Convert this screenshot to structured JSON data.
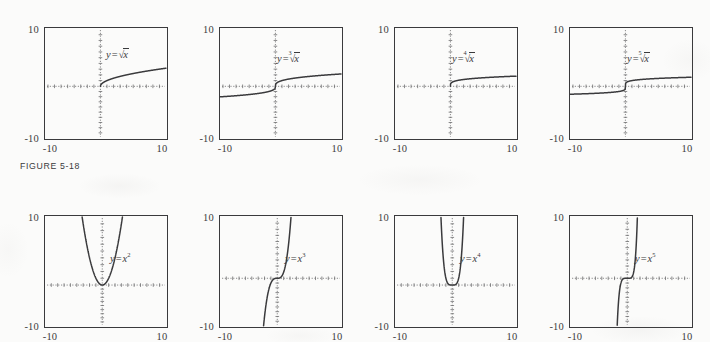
{
  "figure": {
    "caption": "FIGURE 5-18",
    "background_color": "#fbfbfa",
    "ink_color": "#3a3a3c",
    "axis_color": "#6e6e70"
  },
  "axis_labels": {
    "y_top": "10",
    "y_bottom": "-10",
    "x_left": "-10",
    "x_right": "10"
  },
  "chart_data": [
    {
      "type": "line",
      "panel": 1,
      "row": 1,
      "title": "y = √x",
      "label_parts": {
        "lhs": "y",
        "op": "=",
        "kind": "radical",
        "index": "",
        "radicand": "x"
      },
      "function": "sqrt(x)",
      "exponent": "1/2",
      "xlabel": "",
      "ylabel": "",
      "xlim": [
        -10,
        10
      ],
      "ylim": [
        -10,
        10
      ],
      "xticks": [
        "-10",
        "10"
      ],
      "yticks": [
        "10",
        "-10"
      ],
      "grid": false,
      "domain": [
        0,
        10
      ],
      "x": [
        0,
        0.5,
        1,
        2,
        3,
        4,
        5,
        6,
        7,
        8,
        9,
        10
      ],
      "y": [
        0,
        0.71,
        1,
        1.41,
        1.73,
        2,
        2.24,
        2.45,
        2.65,
        2.83,
        3,
        3.16
      ]
    },
    {
      "type": "line",
      "panel": 2,
      "row": 1,
      "title": "y = ∛ x",
      "label_parts": {
        "lhs": "y",
        "op": "=",
        "kind": "radical",
        "index": "3",
        "radicand": "x"
      },
      "function": "cbrt(x)",
      "exponent": "1/3",
      "xlabel": "",
      "ylabel": "",
      "xlim": [
        -10,
        10
      ],
      "ylim": [
        -10,
        10
      ],
      "xticks": [
        "-10",
        "10"
      ],
      "yticks": [
        "10",
        "-10"
      ],
      "grid": false,
      "domain": [
        -10,
        10
      ],
      "x": [
        -10,
        -8,
        -6,
        -4,
        -2,
        -1,
        0,
        1,
        2,
        4,
        6,
        8,
        10
      ],
      "y": [
        -2.15,
        -2,
        -1.82,
        -1.59,
        -1.26,
        -1,
        0,
        1,
        1.26,
        1.59,
        1.82,
        2,
        2.15
      ]
    },
    {
      "type": "line",
      "panel": 3,
      "row": 1,
      "title": "y = ⁴√x",
      "label_parts": {
        "lhs": "y",
        "op": "=",
        "kind": "radical",
        "index": "4",
        "radicand": "x"
      },
      "function": "x^(1/4)",
      "exponent": "1/4",
      "xlabel": "",
      "ylabel": "",
      "xlim": [
        -10,
        10
      ],
      "ylim": [
        -10,
        10
      ],
      "xticks": [
        "-10",
        "10"
      ],
      "yticks": [
        "10",
        "-10"
      ],
      "grid": false,
      "domain": [
        0,
        10
      ],
      "x": [
        0,
        0.5,
        1,
        2,
        3,
        4,
        5,
        6,
        7,
        8,
        9,
        10
      ],
      "y": [
        0,
        0.84,
        1,
        1.19,
        1.32,
        1.41,
        1.5,
        1.57,
        1.63,
        1.68,
        1.73,
        1.78
      ]
    },
    {
      "type": "line",
      "panel": 4,
      "row": 1,
      "title": "y = ⁵√x",
      "label_parts": {
        "lhs": "y",
        "op": "=",
        "kind": "radical",
        "index": "5",
        "radicand": "x"
      },
      "function": "x^(1/5)",
      "exponent": "1/5",
      "xlabel": "",
      "ylabel": "",
      "xlim": [
        -10,
        10
      ],
      "ylim": [
        -10,
        10
      ],
      "xticks": [
        "-10",
        "10"
      ],
      "yticks": [
        "10",
        "-10"
      ],
      "grid": false,
      "domain": [
        -10,
        10
      ],
      "x": [
        -10,
        -8,
        -6,
        -4,
        -2,
        -1,
        0,
        1,
        2,
        4,
        6,
        8,
        10
      ],
      "y": [
        -1.58,
        -1.52,
        -1.43,
        -1.32,
        -1.15,
        -1,
        0,
        1,
        1.15,
        1.32,
        1.43,
        1.52,
        1.58
      ]
    },
    {
      "type": "line",
      "panel": 5,
      "row": 2,
      "title": "y = x2",
      "label_parts": {
        "lhs": "y",
        "op": "=",
        "kind": "power",
        "base": "x",
        "exponent": "2"
      },
      "function": "x^2",
      "exponent": "2",
      "xlabel": "",
      "ylabel": "",
      "xlim": [
        -10,
        10
      ],
      "ylim": [
        -10,
        10
      ],
      "xticks": [
        "-10",
        "10"
      ],
      "yticks": [
        "10",
        "-10"
      ],
      "grid": false,
      "domain": [
        -3.16,
        3.16
      ],
      "x": [
        -3.16,
        -2.5,
        -2,
        -1.5,
        -1,
        -0.5,
        0,
        0.5,
        1,
        1.5,
        2,
        2.5,
        3.16
      ],
      "y": [
        10,
        6.25,
        4,
        2.25,
        1,
        0.25,
        0,
        0.25,
        1,
        2.25,
        4,
        6.25,
        10
      ]
    },
    {
      "type": "line",
      "panel": 6,
      "row": 2,
      "title": "y = x3",
      "label_parts": {
        "lhs": "y",
        "op": "=",
        "kind": "power",
        "base": "x",
        "exponent": "3"
      },
      "function": "x^3",
      "exponent": "3",
      "xlabel": "",
      "ylabel": "",
      "xlim": [
        -10,
        10
      ],
      "ylim": [
        -10,
        10
      ],
      "xticks": [
        "-10",
        "10"
      ],
      "yticks": [
        "10",
        "-10"
      ],
      "grid": false,
      "domain": [
        -2.15,
        2.15
      ],
      "x": [
        -2.15,
        -2,
        -1.5,
        -1,
        -0.5,
        0,
        0.5,
        1,
        1.5,
        2,
        2.15
      ],
      "y": [
        -10,
        -8,
        -3.38,
        -1,
        -0.13,
        0,
        0.13,
        1,
        3.38,
        8,
        10
      ]
    },
    {
      "type": "line",
      "panel": 7,
      "row": 2,
      "title": "y = x4",
      "label_parts": {
        "lhs": "y",
        "op": "=",
        "kind": "power",
        "base": "x",
        "exponent": "4"
      },
      "function": "x^4",
      "exponent": "4",
      "xlabel": "",
      "ylabel": "",
      "xlim": [
        -10,
        10
      ],
      "ylim": [
        -10,
        10
      ],
      "xticks": [
        "-10",
        "10"
      ],
      "yticks": [
        "10",
        "-10"
      ],
      "grid": false,
      "domain": [
        -1.78,
        1.78
      ],
      "x": [
        -1.78,
        -1.6,
        -1.4,
        -1.2,
        -1,
        -0.75,
        -0.5,
        0,
        0.5,
        0.75,
        1,
        1.2,
        1.4,
        1.6,
        1.78
      ],
      "y": [
        10,
        6.55,
        3.84,
        2.07,
        1,
        0.32,
        0.06,
        0,
        0.06,
        0.32,
        1,
        2.07,
        3.84,
        6.55,
        10
      ]
    },
    {
      "type": "line",
      "panel": 8,
      "row": 2,
      "title": "y = x5",
      "label_parts": {
        "lhs": "y",
        "op": "=",
        "kind": "power",
        "base": "x",
        "exponent": "5"
      },
      "function": "x^5",
      "exponent": "5",
      "xlabel": "",
      "ylabel": "",
      "xlim": [
        -10,
        10
      ],
      "ylim": [
        -10,
        10
      ],
      "xticks": [
        "-10",
        "10"
      ],
      "yticks": [
        "10",
        "-10"
      ],
      "grid": false,
      "domain": [
        -1.58,
        1.58
      ],
      "x": [
        -1.58,
        -1.4,
        -1.2,
        -1,
        -0.75,
        -0.5,
        0,
        0.5,
        0.75,
        1,
        1.2,
        1.4,
        1.58
      ],
      "y": [
        -10,
        -5.38,
        -2.49,
        -1,
        -0.24,
        -0.03,
        0,
        0.03,
        0.24,
        1,
        2.49,
        5.38,
        10
      ]
    }
  ]
}
